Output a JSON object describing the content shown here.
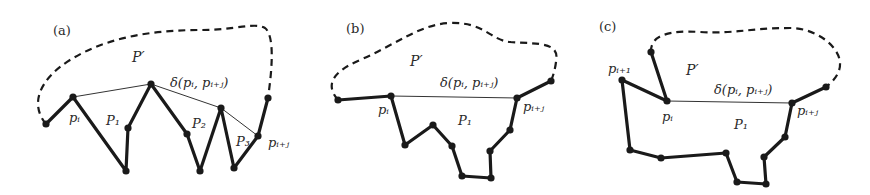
{
  "figure": {
    "panels": [
      {
        "id": "a",
        "label": "(a)",
        "region_label": "P′",
        "chord_label": "δ(pᵢ, pᵢ₊ⱼ)",
        "vertex_labels": {
          "p_i": "pᵢ",
          "p_i_plus_j": "pᵢ₊ⱼ"
        },
        "pocket_labels": [
          "P₁",
          "P₂",
          "P₃"
        ]
      },
      {
        "id": "b",
        "label": "(b)",
        "region_label": "P′",
        "chord_label": "δ(pᵢ, pᵢ₊ⱼ)",
        "vertex_labels": {
          "p_i": "pᵢ",
          "p_i_plus_j": "pᵢ₊ⱼ"
        },
        "pocket_labels": [
          "P₁"
        ]
      },
      {
        "id": "c",
        "label": "(c)",
        "region_label": "P′",
        "chord_label": "δ(pᵢ, pᵢ₊ⱼ)",
        "vertex_labels": {
          "p_i": "pᵢ",
          "p_i_plus_1": "pᵢ₊₁",
          "p_i_plus_j": "pᵢ₊ⱼ"
        },
        "pocket_labels": [
          "P₁"
        ]
      }
    ],
    "colors": {
      "stroke": "#1a1a1a",
      "text": "#2a2a2a",
      "background": "#ffffff"
    }
  }
}
